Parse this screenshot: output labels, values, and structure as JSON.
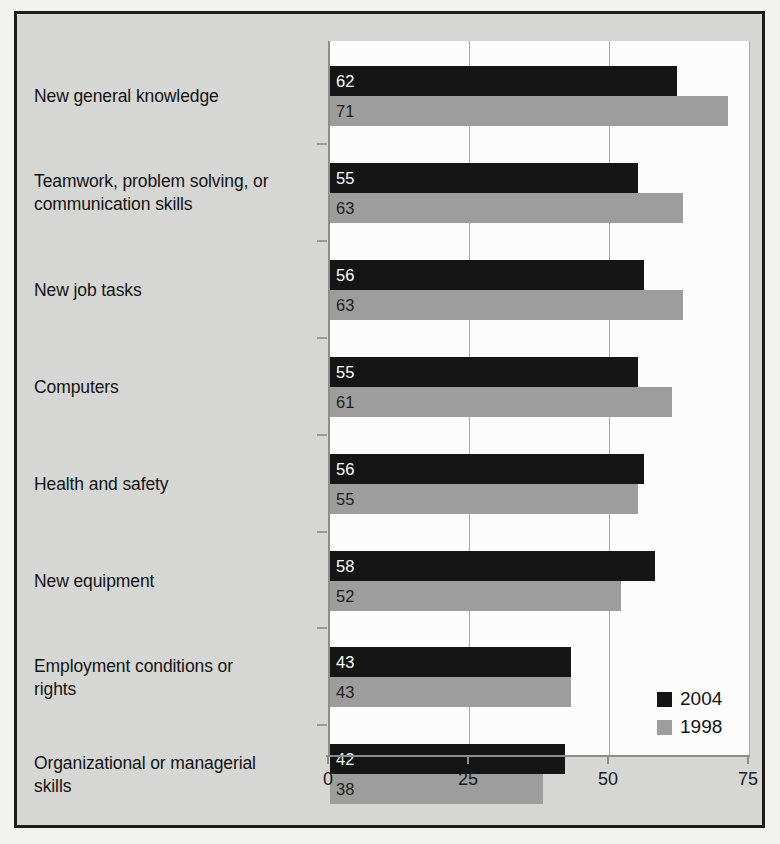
{
  "chart_data": {
    "type": "bar",
    "orientation": "horizontal",
    "title": "",
    "xlabel": "",
    "ylabel": "",
    "xlim": [
      0,
      75
    ],
    "xticks": [
      "0",
      "25",
      "50",
      "75"
    ],
    "grid": true,
    "legend_position": "bottom-right",
    "categories": [
      "New general knowledge",
      "Teamwork, problem  solving, or communication  skills",
      "New job tasks",
      "Computers",
      "Health and safety",
      "New equipment",
      "Employment conditions or rights",
      "Organizational or managerial skills"
    ],
    "category_lines": [
      [
        "New general knowledge"
      ],
      [
        "Teamwork, problem  solving, or",
        "communication  skills"
      ],
      [
        "New job tasks"
      ],
      [
        "Computers"
      ],
      [
        "Health and safety"
      ],
      [
        "New equipment"
      ],
      [
        "Employment conditions or",
        "rights"
      ],
      [
        "Organizational or managerial",
        "skills"
      ]
    ],
    "series": [
      {
        "name": "2004",
        "color": "#151515",
        "values": [
          62,
          55,
          56,
          55,
          56,
          58,
          43,
          42
        ]
      },
      {
        "name": "1998",
        "color": "#9d9d9d",
        "values": [
          71,
          63,
          63,
          61,
          55,
          52,
          43,
          38
        ]
      }
    ]
  },
  "legend": {
    "entries": [
      {
        "label": "2004",
        "color": "#151515"
      },
      {
        "label": "1998",
        "color": "#9d9d9d"
      }
    ]
  },
  "axis": {
    "ticks": [
      {
        "label": "0",
        "value": 0
      },
      {
        "label": "25",
        "value": 25
      },
      {
        "label": "50",
        "value": 50
      },
      {
        "label": "75",
        "value": 75
      }
    ]
  },
  "colors": {
    "series_2004": "#151515",
    "series_1998": "#9d9d9d",
    "panel_background": "#d6d6d4",
    "plot_background": "#fcfcfc",
    "frame_border": "#1c1c1c",
    "gridline": "#a9a9a9"
  }
}
